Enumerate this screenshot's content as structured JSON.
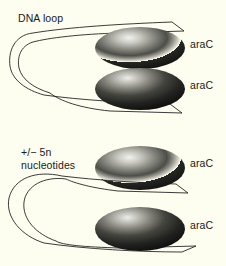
{
  "figure": {
    "background_color": "#fdfdf0",
    "ink_color": "#1a1a18",
    "width": 226,
    "height": 266
  },
  "labels": {
    "dna_loop": "DNA loop",
    "nucleotides_line1": "+/− 5n",
    "nucleotides_line2": "nucleotides",
    "arac_top_upper": "araC",
    "arac_top_lower": "araC",
    "arac_bottom_upper": "araC",
    "arac_bottom_lower": "araC"
  },
  "panels": [
    {
      "name": "top-panel",
      "annotation": "DNA loop",
      "proteins": [
        "araC",
        "araC"
      ],
      "loop_size": "small"
    },
    {
      "name": "bottom-panel",
      "annotation": "+/− 5n nucleotides",
      "proteins": [
        "araC",
        "araC"
      ],
      "loop_size": "large"
    }
  ],
  "protein_blobs": [
    {
      "name": "arac-ellipse-1",
      "cx": 140,
      "cy": 48,
      "rx": 45,
      "ry": 21
    },
    {
      "name": "arac-ellipse-2",
      "cx": 140,
      "cy": 89,
      "rx": 45,
      "ry": 21
    },
    {
      "name": "arac-ellipse-3",
      "cx": 140,
      "cy": 168,
      "rx": 45,
      "ry": 22
    },
    {
      "name": "arac-ellipse-4",
      "cx": 140,
      "cy": 229,
      "rx": 45,
      "ry": 22
    }
  ]
}
